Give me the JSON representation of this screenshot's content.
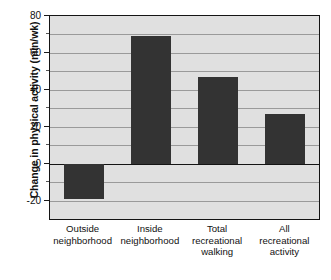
{
  "chart_data": {
    "type": "bar",
    "title": "",
    "subtitle": "",
    "xlabel": "",
    "ylabel": "Change in physical activity (min/wk)",
    "categories": [
      "Outside neighborhood",
      "Inside neighborhood",
      "Total recreational walking",
      "All recreational activity"
    ],
    "category_lines": [
      [
        "Outside",
        "neighborhood"
      ],
      [
        "Inside",
        "neighborhood"
      ],
      [
        "Total",
        "recreational",
        "walking"
      ],
      [
        "All",
        "recreational",
        "activity"
      ]
    ],
    "values": [
      -19,
      69,
      47,
      27
    ],
    "ylim": [
      -30,
      80
    ],
    "ytick_labels": [
      "80",
      "60",
      "40",
      "20",
      "0",
      "-20"
    ],
    "ytick_values": [
      80,
      60,
      40,
      20,
      0,
      -20
    ],
    "minor_tick_values": [
      70,
      50,
      30,
      10,
      -10,
      -30
    ],
    "grid": true,
    "grid_axis": "y",
    "legend": "none",
    "bar_color": "#333333",
    "plot_background": "#e0e0e0",
    "axis_color": "#141414",
    "gridline_color": "#9a9a9a"
  }
}
